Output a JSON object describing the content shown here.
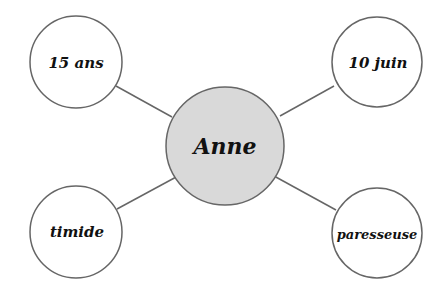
{
  "diagram": {
    "type": "mind-map",
    "center": {
      "label": "Anne",
      "fill": "#d9d9d9",
      "stroke": "#666666"
    },
    "nodes": [
      {
        "id": "top-left",
        "label": "15 ans"
      },
      {
        "id": "top-right",
        "label": "10 juin"
      },
      {
        "id": "bottom-left",
        "label": "timide"
      },
      {
        "id": "bottom-right",
        "label": "paresseuse"
      }
    ],
    "colors": {
      "node_fill": "#ffffff",
      "stroke": "#666666",
      "text": "#111111"
    }
  }
}
